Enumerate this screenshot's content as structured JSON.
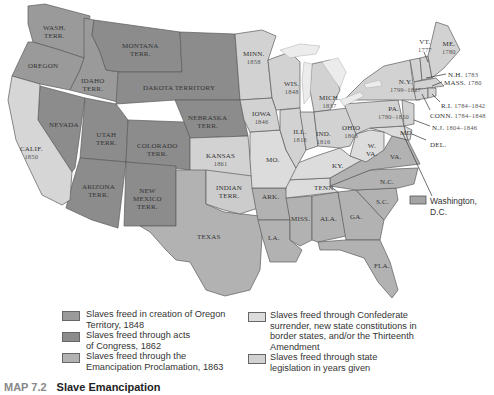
{
  "map": {
    "colors": {
      "oregon_1848": "#9a9a9a",
      "congress_1862": "#8c8c8c",
      "emancipation_1863": "#b2b2b2",
      "confederate_surrender_13th": "#dcdcdc",
      "state_legislation": "#d2d2d2",
      "dc": "#a4a4a4",
      "water": "#ffffff",
      "border": "#5c5c5c"
    },
    "regions": {
      "wash": {
        "name": "WASH.",
        "sub": "TERR."
      },
      "oregon": {
        "name": "OREGON"
      },
      "idaho": {
        "name": "IDAHO",
        "sub": "TERR."
      },
      "montana": {
        "name": "MONTANA",
        "sub": "TERR."
      },
      "dakota": {
        "name": "DAKOTA TERRITORY"
      },
      "nebraska": {
        "name": "NEBRASKA",
        "sub": "TERR."
      },
      "nevada": {
        "name": "NEVADA"
      },
      "utah": {
        "name": "UTAH",
        "sub": "TERR."
      },
      "colorado": {
        "name": "COLORADO",
        "sub": "TERR."
      },
      "calif": {
        "name": "CALIF.",
        "year": "1850"
      },
      "kansas": {
        "name": "KANSAS",
        "year": "1861"
      },
      "arizona": {
        "name": "ARIZONA",
        "sub": "TERR."
      },
      "newmexico": {
        "name": "NEW",
        "sub": "MEXICO",
        "sub2": "TERR."
      },
      "indian": {
        "name": "INDIAN",
        "sub": "TERR."
      },
      "texas": {
        "name": "TEXAS"
      },
      "minn": {
        "name": "MINN.",
        "year": "1858"
      },
      "wis": {
        "name": "WIS.",
        "year": "1848"
      },
      "mich": {
        "name": "MICH.",
        "year": "1837"
      },
      "iowa": {
        "name": "IOWA",
        "year": "1846"
      },
      "ill": {
        "name": "ILL.",
        "year": "1818"
      },
      "ind": {
        "name": "IND.",
        "year": "1816"
      },
      "ohio": {
        "name": "OHIO",
        "year": "1803"
      },
      "mo": {
        "name": "MO."
      },
      "ky": {
        "name": "KY."
      },
      "wva": {
        "name": "W.",
        "sub": "VA."
      },
      "va": {
        "name": "VA."
      },
      "md": {
        "name": "MD."
      },
      "del": {
        "name": "DEL."
      },
      "nc": {
        "name": "N.C."
      },
      "tenn": {
        "name": "TENN."
      },
      "ark": {
        "name": "ARK."
      },
      "sc": {
        "name": "S.C."
      },
      "miss": {
        "name": "MISS."
      },
      "ala": {
        "name": "ALA."
      },
      "ga": {
        "name": "GA."
      },
      "la": {
        "name": "LA."
      },
      "fla": {
        "name": "FLA."
      },
      "ny": {
        "name": "N.Y.",
        "year": "1799–1827"
      },
      "pa": {
        "name": "PA.",
        "year": "1780–1850"
      },
      "vt": {
        "name": "VT.",
        "year": "1777"
      },
      "me": {
        "name": "ME.",
        "year": "1780"
      },
      "nh": {
        "name": "N.H.",
        "year": "1783"
      },
      "mass": {
        "name": "MASS.",
        "year": "1780"
      },
      "ri": {
        "name": "R.I.",
        "year": "1784–1842"
      },
      "conn": {
        "name": "CONN.",
        "year": "1784–1848"
      },
      "nj": {
        "name": "N.J.",
        "year": "1804–1846"
      }
    },
    "dc_callout": "Washington, D.C."
  },
  "legend": {
    "left": [
      {
        "text": "Slaves freed in creation of Oregon Territory, 1848"
      },
      {
        "text": "Slaves freed through acts of Congress, 1862"
      },
      {
        "text": "Slaves freed through the Emancipation Proclamation, 1863"
      }
    ],
    "right": [
      {
        "text": "Slaves freed through Confederate surrender, new state constitutions in border states, and/or the Thirteenth Amendment"
      },
      {
        "text": "Slaves freed through state legislation in years given"
      }
    ]
  },
  "caption": {
    "number": "MAP 7.2",
    "title": "Slave Emancipation"
  }
}
